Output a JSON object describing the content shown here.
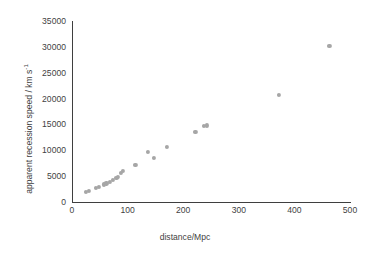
{
  "chart_data": {
    "type": "scatter",
    "title": "",
    "xlabel": "distance/Mpc",
    "ylabel": "apparent recession speed / km s",
    "ylabel_exponent": "-1",
    "xlim": [
      0,
      500
    ],
    "ylim": [
      0,
      35000
    ],
    "grid": false,
    "legend": "none",
    "marker_color": "#a6a6a6",
    "axis_color": "#3f3f3f",
    "xticks": [
      0,
      100,
      200,
      300,
      400,
      500
    ],
    "xtick_labels": [
      "0",
      "100",
      "200",
      "300",
      "400",
      "500"
    ],
    "yticks": [
      0,
      5000,
      10000,
      15000,
      20000,
      25000,
      30000,
      35000
    ],
    "ytick_labels": [
      "0",
      "5000",
      "10000",
      "15000",
      "20000",
      "25000",
      "30000",
      "35000"
    ],
    "series": [
      {
        "name": "galaxies",
        "points": [
          [
            25,
            1900
          ],
          [
            30,
            2200
          ],
          [
            43,
            2700
          ],
          [
            48,
            2900
          ],
          [
            57,
            3400
          ],
          [
            62,
            3600
          ],
          [
            68,
            3900
          ],
          [
            74,
            4200
          ],
          [
            80,
            4600
          ],
          [
            83,
            4900
          ],
          [
            88,
            5700
          ],
          [
            92,
            6000
          ],
          [
            114,
            7100
          ],
          [
            137,
            9700
          ],
          [
            148,
            8500
          ],
          [
            170,
            10600
          ],
          [
            222,
            13600
          ],
          [
            237,
            14700
          ],
          [
            242,
            14800
          ],
          [
            372,
            20700
          ],
          [
            463,
            30200
          ]
        ]
      }
    ]
  }
}
